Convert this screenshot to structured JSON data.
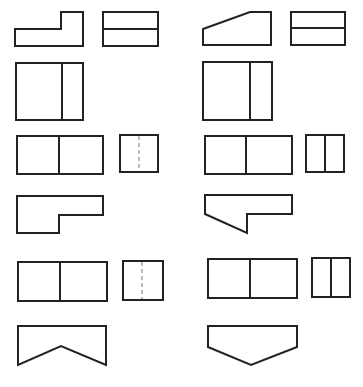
{
  "diagram": {
    "title": "",
    "stroke_color": "#222222",
    "hidden_line_color": "#8a8a8a",
    "background": "#ffffff",
    "left_column": {
      "view1_front": {
        "type": "L-shape",
        "points": "15,29 61,29 61,12 83,12 83,46 15,46"
      },
      "view1_side": {
        "type": "rect-with-horizontal-line",
        "x": 103,
        "y": 12,
        "w": 55,
        "h": 34,
        "line_y": 29
      },
      "view1_top": {
        "type": "rect-with-vertical-line",
        "x": 16,
        "y": 63,
        "w": 67,
        "h": 57,
        "line_x": 62
      },
      "view2_front": {
        "type": "rect-with-vertical-line",
        "x": 17,
        "y": 136,
        "w": 86,
        "h": 38,
        "line_x": 59
      },
      "view2_side": {
        "type": "rect-with-hidden-line",
        "x": 120,
        "y": 135,
        "w": 38,
        "h": 37,
        "line_x": 139
      },
      "view2_top": {
        "type": "stepped-shape",
        "points": "17,196 103,196 103,215 59,215 59,233 17,233"
      },
      "view3_front": {
        "type": "rect-with-vertical-line",
        "x": 18,
        "y": 262,
        "w": 89,
        "h": 39,
        "line_x": 60
      },
      "view3_side": {
        "type": "rect-with-hidden-line",
        "x": 123,
        "y": 261,
        "w": 40,
        "h": 39,
        "line_x": 142
      },
      "view3_top": {
        "type": "notched-shape",
        "points": "18,326 106,326 106,365 61,346 18,365"
      }
    },
    "right_column": {
      "view1_front": {
        "type": "sloped-trapezoid",
        "points": "203,29 250,12 271,12 271,45 203,45"
      },
      "view1_side": {
        "type": "rect-with-horizontal-line",
        "x": 291,
        "y": 12,
        "w": 54,
        "h": 33,
        "line_y": 28
      },
      "view1_top": {
        "type": "rect-with-vertical-line",
        "x": 203,
        "y": 62,
        "w": 69,
        "h": 58,
        "line_x": 250
      },
      "view2_front": {
        "type": "rect-with-vertical-line",
        "x": 205,
        "y": 136,
        "w": 87,
        "h": 38,
        "line_x": 246
      },
      "view2_side": {
        "type": "rect-with-vertical-line",
        "x": 306,
        "y": 135,
        "w": 38,
        "h": 37,
        "line_x": 325
      },
      "view2_top": {
        "type": "sloped-stepped-shape",
        "points": "205,195 292,195 292,214 247,214 247,233 205,214"
      },
      "view3_front": {
        "type": "rect-with-vertical-line",
        "x": 208,
        "y": 259,
        "w": 89,
        "h": 39,
        "line_x": 250
      },
      "view3_side": {
        "type": "rect-with-vertical-line",
        "x": 312,
        "y": 258,
        "w": 38,
        "h": 39,
        "line_x": 331
      },
      "view3_top": {
        "type": "pentagon-point-down",
        "points": "208,326 297,326 297,347 251,365 208,347"
      }
    }
  }
}
